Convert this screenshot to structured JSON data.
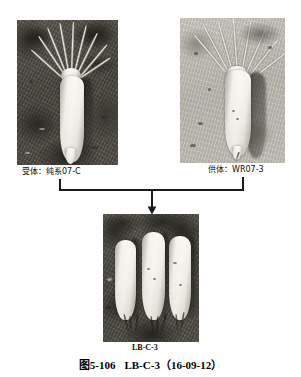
{
  "figure": {
    "caption_label": "图5-106",
    "caption_name": "LB-C-3",
    "caption_date": "（16-09-12）",
    "caption_full": "图5-106　LB-C-3（16-09-12）"
  },
  "panels": {
    "recipient": {
      "label": "受体：纯系07-C",
      "role": "受体",
      "line_name": "纯系07-C",
      "alt": "single white radish root with leaf petioles on dark soil"
    },
    "donor": {
      "label": "供体：WR07-3",
      "role": "供体",
      "line_name": "WR07-3",
      "alt": "single white radish root with leaf petioles on pale soil"
    },
    "progeny": {
      "label": "LB-C-3",
      "alt": "three white radish roots lying side by side on dark soil"
    }
  },
  "connector": {
    "type": "cross-arrow",
    "description": "bracket joining recipient and donor leading down to progeny",
    "line_color": "#1a1a1a"
  },
  "colors": {
    "background": "#ffffff",
    "text": "#000000",
    "line": "#1a1a1a"
  }
}
